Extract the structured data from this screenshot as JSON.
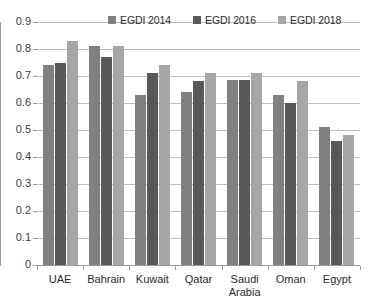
{
  "chart_data": {
    "type": "bar",
    "title": "",
    "xlabel": "",
    "ylabel": "",
    "ylim": [
      0,
      0.9
    ],
    "grid": true,
    "legend_position": "top-center",
    "categories": [
      "UAE",
      "Bahrain",
      "Kuwait",
      "Qatar",
      "Saudi\nArabia",
      "Oman",
      "Egypt"
    ],
    "ytick_labels": [
      "0.9",
      "0.8",
      "0.7",
      "0.6",
      "0.5",
      "0.4",
      "0.3",
      "0.2",
      "0.1",
      "0"
    ],
    "ytick_values": [
      0.9,
      0.8,
      0.7,
      0.6,
      0.5,
      0.4,
      0.3,
      0.2,
      0.1,
      0
    ],
    "series": [
      {
        "name": "EGDI 2014",
        "color": "#808080",
        "values": [
          0.74,
          0.81,
          0.63,
          0.64,
          0.685,
          0.63,
          0.51
        ]
      },
      {
        "name": "EGDI 2016",
        "color": "#585858",
        "values": [
          0.75,
          0.77,
          0.71,
          0.68,
          0.685,
          0.6,
          0.46
        ]
      },
      {
        "name": "EGDI 2018",
        "color": "#a6a6a6",
        "values": [
          0.83,
          0.81,
          0.74,
          0.71,
          0.71,
          0.68,
          0.48
        ]
      }
    ]
  },
  "colors": {
    "gridline": "#bfbfbf",
    "axis": "#9a9a9a",
    "text": "#2b2b2b",
    "background": "#ffffff"
  }
}
